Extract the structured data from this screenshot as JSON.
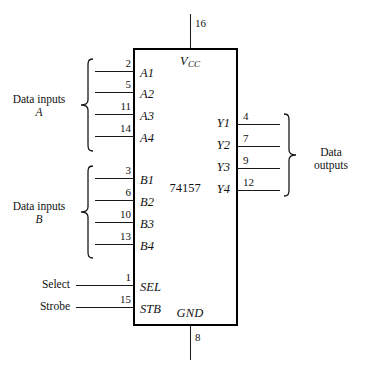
{
  "diagram": {
    "chip_name": "74157",
    "power": {
      "vcc_label": "V",
      "vcc_sub": "CC",
      "vcc_pin": "16",
      "gnd_label": "GND",
      "gnd_pin": "8"
    },
    "groups": {
      "data_inputs_a": {
        "line1": "Data inputs",
        "line2": "A"
      },
      "data_inputs_b": {
        "line1": "Data inputs",
        "line2": "B"
      },
      "data_outputs": {
        "line1": "Data",
        "line2": "outputs"
      }
    },
    "inputs_a": [
      {
        "pin": "2",
        "label": "A1"
      },
      {
        "pin": "5",
        "label": "A2"
      },
      {
        "pin": "11",
        "label": "A3"
      },
      {
        "pin": "14",
        "label": "A4"
      }
    ],
    "inputs_b": [
      {
        "pin": "3",
        "label": "B1"
      },
      {
        "pin": "6",
        "label": "B2"
      },
      {
        "pin": "10",
        "label": "B3"
      },
      {
        "pin": "13",
        "label": "B4"
      }
    ],
    "outputs_y": [
      {
        "pin": "4",
        "label": "Y1"
      },
      {
        "pin": "7",
        "label": "Y2"
      },
      {
        "pin": "9",
        "label": "Y3"
      },
      {
        "pin": "12",
        "label": "Y4"
      }
    ],
    "controls": [
      {
        "name": "Select",
        "pin": "1",
        "label": "SEL"
      },
      {
        "name": "Strobe",
        "pin": "15",
        "label": "STB"
      }
    ],
    "colors": {
      "line": "#1a1a1a",
      "background": "#ffffff",
      "text": "#111111"
    }
  }
}
